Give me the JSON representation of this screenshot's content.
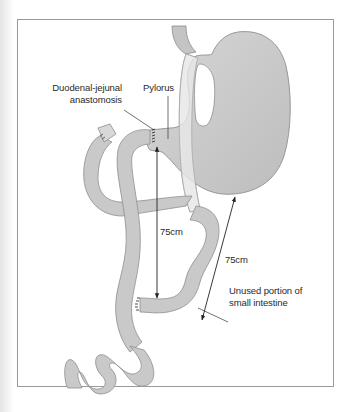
{
  "diagram": {
    "labels": {
      "duodenal_jejunal_line1": "Duodenal-jejunal",
      "duodenal_jejunal_line2": "anastomosis",
      "pylorus": "Pylorus",
      "measure_inner": "75cm",
      "measure_outer": "75cm",
      "unused_line1": "Unused portion of",
      "unused_line2": "small intestine"
    },
    "colors": {
      "organ_fill": "#c9c9c9",
      "organ_highlight": "#dcdcdc",
      "organ_stroke": "#8e8e8e",
      "esophagus_light": "#ececec",
      "frame_border": "#9a9a9a",
      "text": "#2a2a2a",
      "arrow": "#222222"
    }
  }
}
